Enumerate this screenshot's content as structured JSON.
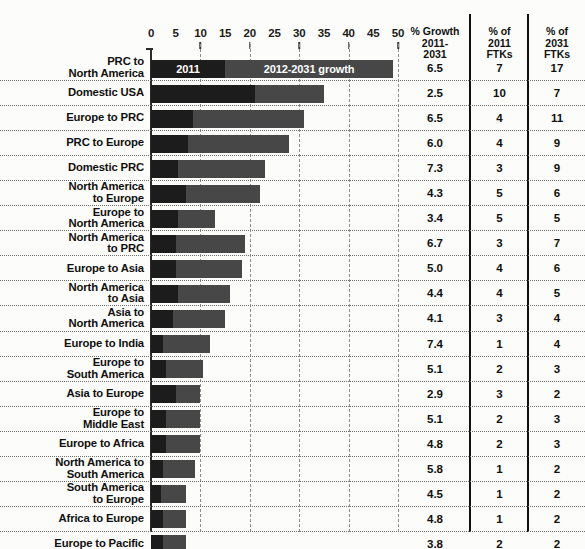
{
  "chart_data": {
    "type": "bar",
    "title": "",
    "subtitle": "",
    "orientation": "horizontal",
    "stacked": true,
    "xlabel": "",
    "ylabel": "",
    "xlim": [
      0,
      50
    ],
    "x_ticks": [
      0,
      5,
      10,
      15,
      20,
      25,
      30,
      35,
      40,
      45,
      50
    ],
    "gridlines_at": [
      10,
      20,
      30,
      40,
      50
    ],
    "grid": true,
    "legend_position": "inside-first-bar",
    "legend": [
      {
        "name": "2011",
        "color": "#1c1c1c"
      },
      {
        "name": "2012-2031 growth",
        "color": "#474747"
      }
    ],
    "categories": [
      "PRC to North America",
      "Domestic USA",
      "Europe to PRC",
      "PRC to Europe",
      "Domestic PRC",
      "North America to Europe",
      "Europe to North America",
      "North America to PRC",
      "Europe to Asia",
      "North America to Asia",
      "Asia to North America",
      "Europe to India",
      "Europe to South America",
      "Asia to Europe",
      "Europe to Middle East",
      "Europe to Africa",
      "North America to South America",
      "South America to Europe",
      "Africa to Europe",
      "Europe to Pacific"
    ],
    "series": [
      {
        "name": "2011",
        "color": "#1c1c1c",
        "values": [
          15.0,
          21.0,
          8.5,
          7.5,
          5.5,
          7.0,
          5.5,
          5.0,
          5.0,
          5.5,
          4.5,
          2.5,
          3.0,
          5.0,
          3.0,
          3.0,
          2.5,
          2.0,
          2.5,
          2.5
        ]
      },
      {
        "name": "2012-2031 growth",
        "color": "#474747",
        "values": [
          34.0,
          14.0,
          22.5,
          20.5,
          17.5,
          15.0,
          7.5,
          14.0,
          13.5,
          10.5,
          10.5,
          9.5,
          7.5,
          5.0,
          7.0,
          7.0,
          6.5,
          5.0,
          4.5,
          4.5
        ]
      }
    ],
    "table_columns": [
      "% Growth 2011-2031",
      "% of 2011 FTKs",
      "% of 2031 FTKs"
    ],
    "table_values": {
      "growth": [
        "6.5",
        "2.5",
        "6.5",
        "6.0",
        "7.3",
        "4.3",
        "3.4",
        "6.7",
        "5.0",
        "4.4",
        "4.1",
        "7.4",
        "5.1",
        "2.9",
        "5.1",
        "4.8",
        "5.8",
        "4.5",
        "4.8",
        "3.8"
      ],
      "ftk_2011": [
        "7",
        "10",
        "4",
        "4",
        "3",
        "5",
        "5",
        "3",
        "4",
        "4",
        "3",
        "1",
        "2",
        "3",
        "2",
        "2",
        "1",
        "1",
        "1",
        "2"
      ],
      "ftk_2031": [
        "17",
        "7",
        "11",
        "9",
        "9",
        "6",
        "5",
        "7",
        "6",
        "5",
        "4",
        "4",
        "3",
        "2",
        "3",
        "3",
        "2",
        "2",
        "2",
        "2"
      ]
    }
  },
  "axis": {
    "ticks": [
      "0",
      "5",
      "10",
      "15",
      "20",
      "25",
      "30",
      "35",
      "40",
      "45",
      "50"
    ]
  },
  "headers": {
    "growth": [
      "% Growth",
      "2011-",
      "2031"
    ],
    "ftk_2011": [
      "% of",
      "2011",
      "FTKs"
    ],
    "ftk_2031": [
      "% of",
      "2031",
      "FTKs"
    ]
  },
  "rows": [
    {
      "label_lines": [
        "PRC to",
        "North America"
      ],
      "base": 15.0,
      "growth": 34.0,
      "pct_growth": "6.5",
      "ftk11": "7",
      "ftk31": "17"
    },
    {
      "label_lines": [
        "Domestic USA"
      ],
      "base": 21.0,
      "growth": 14.0,
      "pct_growth": "2.5",
      "ftk11": "10",
      "ftk31": "7"
    },
    {
      "label_lines": [
        "Europe to PRC"
      ],
      "base": 8.5,
      "growth": 22.5,
      "pct_growth": "6.5",
      "ftk11": "4",
      "ftk31": "11"
    },
    {
      "label_lines": [
        "PRC to Europe"
      ],
      "base": 7.5,
      "growth": 20.5,
      "pct_growth": "6.0",
      "ftk11": "4",
      "ftk31": "9"
    },
    {
      "label_lines": [
        "Domestic PRC"
      ],
      "base": 5.5,
      "growth": 17.5,
      "pct_growth": "7.3",
      "ftk11": "3",
      "ftk31": "9"
    },
    {
      "label_lines": [
        "North America",
        "to Europe"
      ],
      "base": 7.0,
      "growth": 15.0,
      "pct_growth": "4.3",
      "ftk11": "5",
      "ftk31": "6"
    },
    {
      "label_lines": [
        "Europe to",
        "North America"
      ],
      "base": 5.5,
      "growth": 7.5,
      "pct_growth": "3.4",
      "ftk11": "5",
      "ftk31": "5"
    },
    {
      "label_lines": [
        "North America",
        "to PRC"
      ],
      "base": 5.0,
      "growth": 14.0,
      "pct_growth": "6.7",
      "ftk11": "3",
      "ftk31": "7"
    },
    {
      "label_lines": [
        "Europe to Asia"
      ],
      "base": 5.0,
      "growth": 13.5,
      "pct_growth": "5.0",
      "ftk11": "4",
      "ftk31": "6"
    },
    {
      "label_lines": [
        "North America",
        "to Asia"
      ],
      "base": 5.5,
      "growth": 10.5,
      "pct_growth": "4.4",
      "ftk11": "4",
      "ftk31": "5"
    },
    {
      "label_lines": [
        "Asia to",
        "North America"
      ],
      "base": 4.5,
      "growth": 10.5,
      "pct_growth": "4.1",
      "ftk11": "3",
      "ftk31": "4"
    },
    {
      "label_lines": [
        "Europe to India"
      ],
      "base": 2.5,
      "growth": 9.5,
      "pct_growth": "7.4",
      "ftk11": "1",
      "ftk31": "4"
    },
    {
      "label_lines": [
        "Europe to",
        "South America"
      ],
      "base": 3.0,
      "growth": 7.5,
      "pct_growth": "5.1",
      "ftk11": "2",
      "ftk31": "3"
    },
    {
      "label_lines": [
        "Asia to Europe"
      ],
      "base": 5.0,
      "growth": 5.0,
      "pct_growth": "2.9",
      "ftk11": "3",
      "ftk31": "2"
    },
    {
      "label_lines": [
        "Europe to",
        "Middle East"
      ],
      "base": 3.0,
      "growth": 7.0,
      "pct_growth": "5.1",
      "ftk11": "2",
      "ftk31": "3"
    },
    {
      "label_lines": [
        "Europe to Africa"
      ],
      "base": 3.0,
      "growth": 7.0,
      "pct_growth": "4.8",
      "ftk11": "2",
      "ftk31": "3"
    },
    {
      "label_lines": [
        "North America to",
        "South America"
      ],
      "base": 2.5,
      "growth": 6.5,
      "pct_growth": "5.8",
      "ftk11": "1",
      "ftk31": "2"
    },
    {
      "label_lines": [
        "South America",
        "to Europe"
      ],
      "base": 2.0,
      "growth": 5.0,
      "pct_growth": "4.5",
      "ftk11": "1",
      "ftk31": "2"
    },
    {
      "label_lines": [
        "Africa to Europe"
      ],
      "base": 2.5,
      "growth": 4.5,
      "pct_growth": "4.8",
      "ftk11": "1",
      "ftk31": "2"
    },
    {
      "label_lines": [
        "Europe to Pacific"
      ],
      "base": 2.5,
      "growth": 4.5,
      "pct_growth": "3.8",
      "ftk11": "2",
      "ftk31": "2"
    }
  ],
  "colors": {
    "base": "#1c1c1c",
    "growth": "#474747",
    "text": "#101010",
    "grid": "#8d8d8d"
  }
}
